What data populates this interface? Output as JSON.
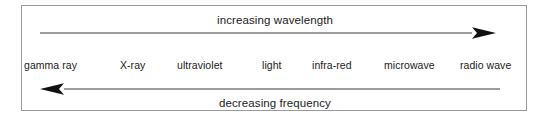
{
  "diagram": {
    "title_top": "increasing wavelength",
    "title_bottom": "decreasing frequency",
    "panel": {
      "border_color": "#9a9a9a",
      "background_color": "#ffffff"
    },
    "arrows": [
      {
        "name": "increasing-wavelength-arrow",
        "direction": "right",
        "label": "increasing wavelength",
        "color": "#3a3a3a"
      },
      {
        "name": "decreasing-frequency-arrow",
        "direction": "left",
        "label": "decreasing frequency",
        "color": "#3a3a3a"
      }
    ],
    "spectrum_bands": [
      {
        "label": "gamma ray",
        "x": 2
      },
      {
        "label": "X-ray",
        "x": 98
      },
      {
        "label": "ultraviolet",
        "x": 155
      },
      {
        "label": "light",
        "x": 240
      },
      {
        "label": "infra-red",
        "x": 290
      },
      {
        "label": "microwave",
        "x": 362
      },
      {
        "label": "radio wave",
        "x": 438
      }
    ],
    "text_color": "#1b1b1b"
  }
}
